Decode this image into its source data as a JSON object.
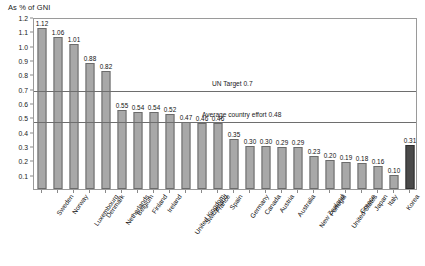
{
  "chart_data": {
    "type": "bar",
    "title": "",
    "ylabel": "As % of GNI",
    "xlabel": "",
    "ylim": [
      0.0,
      1.2
    ],
    "ytick_step": 0.1,
    "grid": false,
    "legend": "none",
    "categories": [
      "Sweden",
      "Norway",
      "Luxembourg",
      "Denmark",
      "Netherlands",
      "Belgium",
      "Finland",
      "Ireland",
      "United Kingdom",
      "Switzerland",
      "France",
      "Spain",
      "Germany",
      "Canada",
      "Austria",
      "Australia",
      "New Zealand",
      "Portugal",
      "United States",
      "Greece",
      "Japan",
      "Italy",
      "Korea",
      "TOTAL DAC"
    ],
    "values": [
      1.12,
      1.06,
      1.01,
      0.88,
      0.82,
      0.55,
      0.54,
      0.54,
      0.52,
      0.47,
      0.46,
      0.46,
      0.35,
      0.3,
      0.3,
      0.29,
      0.29,
      0.23,
      0.2,
      0.19,
      0.18,
      0.16,
      0.1,
      0.31
    ],
    "value_labels": [
      "1.12",
      "1.06",
      "1.01",
      "0.88",
      "0.82",
      "0.55",
      "0.54",
      "0.54",
      "0.52",
      "0.47",
      "0.46",
      "0.46",
      "0.35",
      "0.30",
      "0.30",
      "0.29",
      "0.29",
      "0.23",
      "0.20",
      "0.19",
      "0.18",
      "0.16",
      "0.10",
      "0.31"
    ],
    "ytick_labels": [
      "1.2",
      "1.1",
      "1.0",
      "0.9",
      "0.8",
      "0.7",
      "0.6",
      "0.5",
      "0.4",
      "0.3",
      "0.2",
      "0.1"
    ],
    "ytick_values": [
      1.2,
      1.1,
      1.0,
      0.9,
      0.8,
      0.7,
      0.6,
      0.5,
      0.4,
      0.3,
      0.2,
      0.1
    ],
    "reference_lines": [
      {
        "name": "un-target",
        "value": 0.7,
        "label": "UN Target 0.7"
      },
      {
        "name": "average-country-effort",
        "value": 0.48,
        "label": "Average country effort 0.48"
      }
    ],
    "highlight_index": 23,
    "colors": {
      "bar": "#a8a8a8",
      "bar_border": "#6b6b6b",
      "highlight_bar": "#4a4a4a",
      "highlight_bar_border": "#2f2f2f",
      "reference_line": "#6e6e6e",
      "axis": "#9a9a9a",
      "text": "#111111",
      "background": "#ffffff"
    }
  }
}
